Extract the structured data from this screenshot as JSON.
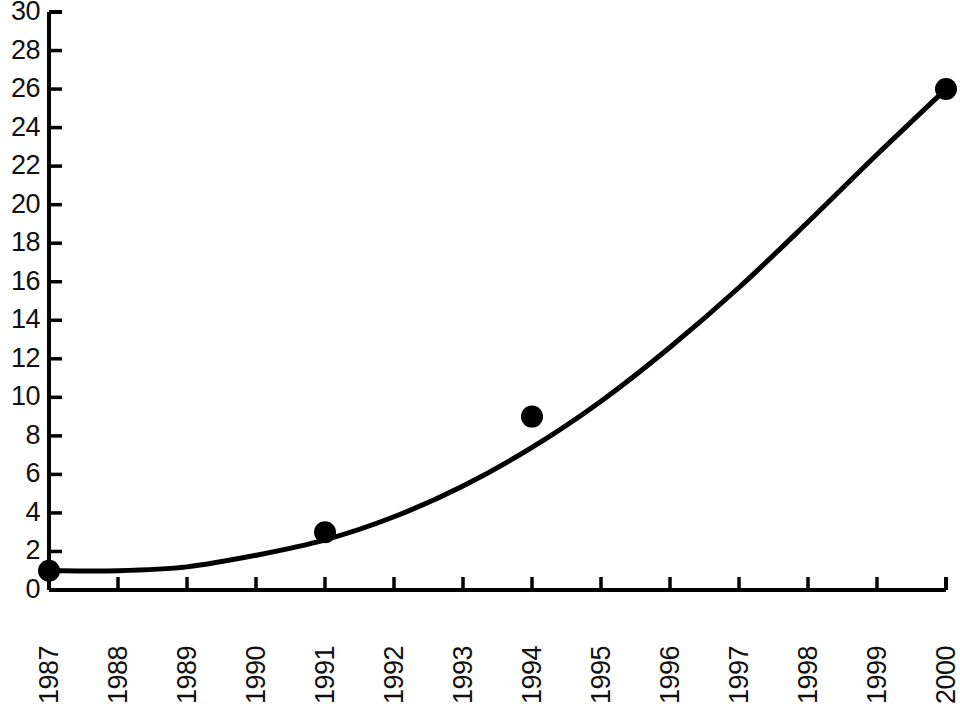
{
  "chart_data": {
    "type": "scatter",
    "title": "",
    "subtitle": "",
    "xlabel": "",
    "ylabel": "",
    "x": [
      1987,
      1991,
      1994,
      2000
    ],
    "values": [
      1,
      3,
      9,
      26
    ],
    "series": [
      {
        "name": "data points",
        "x": [
          1987,
          1991,
          1994,
          2000
        ],
        "values": [
          1,
          3,
          9,
          26
        ],
        "marker": "filled-circle"
      },
      {
        "name": "fitted curve",
        "x": [
          1987,
          1988,
          1989,
          1990,
          1991,
          1992,
          1993,
          1994,
          1995,
          1996,
          1997,
          1998,
          1999,
          2000
        ],
        "values": [
          1.0,
          1.0,
          1.2,
          1.8,
          2.6,
          3.8,
          5.4,
          7.4,
          9.8,
          12.6,
          15.7,
          19.1,
          22.6,
          26.0
        ],
        "style": "smooth-line"
      }
    ],
    "xlim": [
      1987,
      2000
    ],
    "ylim": [
      0,
      30
    ],
    "ytick_step": 2,
    "grid": false,
    "legend": "none",
    "xtick_labels": [
      "1987",
      "1988",
      "1989",
      "1990",
      "1991",
      "1992",
      "1993",
      "1994",
      "1995",
      "1996",
      "1997",
      "1998",
      "1999",
      "2000"
    ],
    "ytick_labels": [
      "0",
      "2",
      "4",
      "6",
      "8",
      "10",
      "12",
      "14",
      "16",
      "18",
      "20",
      "22",
      "24",
      "26",
      "28",
      "30"
    ],
    "xtick_rotation": -90,
    "colors": {
      "axis": "#000000",
      "line": "#000000",
      "marker": "#000000",
      "text": "#111111",
      "background": "#ffffff"
    }
  }
}
